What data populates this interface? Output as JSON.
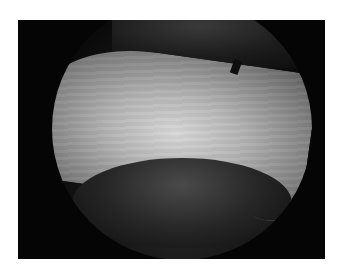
{
  "image": {
    "description": "Grayscale arthroscopic view showing a smooth cartilage surface inside a circular scope field on a black background",
    "colors": {
      "page_background": "#ffffff",
      "frame_background": "#050505",
      "cartilage_highlight": "#d8d8d8",
      "tissue_shadow": "#262626"
    }
  }
}
